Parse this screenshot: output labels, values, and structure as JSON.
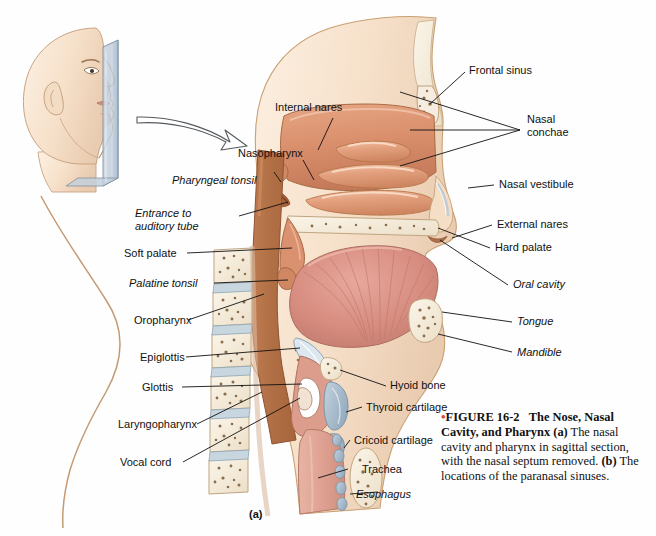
{
  "figure": {
    "panel_letter": "(a)",
    "caption_bullet": "•",
    "caption_number": "FIGURE 16-2",
    "caption_title": "The Nose, Nasal Cavity, and Pharynx",
    "caption_part_a_marker": "(a)",
    "caption_part_a_text": "The nasal cavity and pharynx in sagittal section, with the nasal septum removed.",
    "caption_part_b_marker": "(b)",
    "caption_part_b_text": "The locations of the paranasal sinuses.",
    "bullet_color": "#d4502a"
  },
  "labels_left": [
    {
      "id": "internal-nares",
      "text": "Internal nares",
      "italic": false
    },
    {
      "id": "nasopharynx",
      "text": "Nasopharynx",
      "italic": false
    },
    {
      "id": "pharyngeal-tonsil",
      "text": "Pharyngeal tonsil",
      "italic": true
    },
    {
      "id": "entrance-auditory-tube",
      "text": "Entrance to",
      "text2": "auditory tube",
      "italic": true
    },
    {
      "id": "soft-palate",
      "text": "Soft palate",
      "italic": false
    },
    {
      "id": "palatine-tonsil",
      "text": "Palatine tonsil",
      "italic": true
    },
    {
      "id": "oropharynx",
      "text": "Oropharynx",
      "italic": false
    },
    {
      "id": "epiglottis",
      "text": "Epiglottis",
      "italic": false
    },
    {
      "id": "glottis",
      "text": "Glottis",
      "italic": false
    },
    {
      "id": "laryngopharynx",
      "text": "Laryngopharynx",
      "italic": false
    },
    {
      "id": "vocal-cord",
      "text": "Vocal cord",
      "italic": false
    }
  ],
  "labels_right": [
    {
      "id": "frontal-sinus",
      "text": "Frontal sinus",
      "italic": false
    },
    {
      "id": "nasal-conchae",
      "text": "Nasal",
      "text2": "conchae",
      "italic": false
    },
    {
      "id": "nasal-vestibule",
      "text": "Nasal vestibule",
      "italic": false
    },
    {
      "id": "external-nares",
      "text": "External nares",
      "italic": false
    },
    {
      "id": "hard-palate",
      "text": "Hard palate",
      "italic": false
    },
    {
      "id": "oral-cavity",
      "text": "Oral cavity",
      "italic": true
    },
    {
      "id": "tongue",
      "text": "Tongue",
      "italic": true
    },
    {
      "id": "mandible",
      "text": "Mandible",
      "italic": true
    }
  ],
  "labels_lower": [
    {
      "id": "hyoid-bone",
      "text": "Hyoid bone",
      "italic": false
    },
    {
      "id": "thyroid-cartilage",
      "text": "Thyroid cartilage",
      "italic": false
    },
    {
      "id": "cricoid-cartilage",
      "text": "Cricoid cartilage",
      "italic": false
    },
    {
      "id": "trachea",
      "text": "Trachea",
      "italic": false
    },
    {
      "id": "esophagus",
      "text": "Esophagus",
      "italic": true
    }
  ],
  "illustration": {
    "head_inset_name": "head-profile-with-sagittal-plane",
    "arrow_name": "curved-pointer-arrow",
    "colors": {
      "skin": "#f7e3d0",
      "mucosa": "#dd9272",
      "mucosa_dark": "#b9683f",
      "muscle": "#d9897f",
      "bone": "#f5ecdd",
      "cartilage": "#a8bdcd",
      "plane_glass": "#b9c6d4",
      "outline": "#9b7a5c"
    }
  }
}
